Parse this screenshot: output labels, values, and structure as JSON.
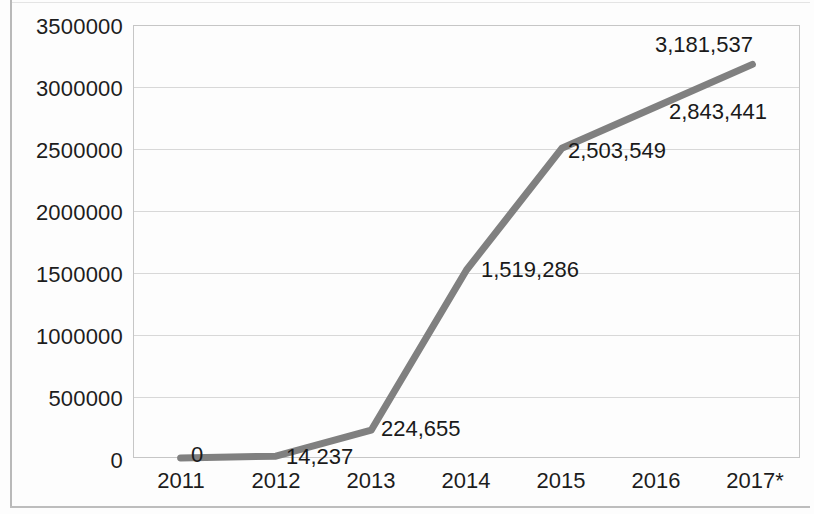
{
  "chart_data": {
    "type": "line",
    "title": "",
    "subtitle": "",
    "xlabel": "",
    "ylabel": "",
    "categories": [
      "2011",
      "2012",
      "2013",
      "2014",
      "2015",
      "2016",
      "2017*"
    ],
    "x": [
      "2011",
      "2012",
      "2013",
      "2014",
      "2015",
      "2016",
      "2017*"
    ],
    "values": [
      0,
      14237,
      224655,
      1519286,
      2503549,
      2843441,
      3181537
    ],
    "data_labels": [
      "0",
      "14,237",
      "224,655",
      "1,519,286",
      "2,503,549",
      "2,843,441",
      "3,181,537"
    ],
    "series": [
      {
        "name": "",
        "values": [
          0,
          14237,
          224655,
          1519286,
          2503549,
          2843441,
          3181537
        ],
        "color": "#808080"
      }
    ],
    "ylim": [
      0,
      3500000
    ],
    "y_tick_values": [
      0,
      500000,
      1000000,
      1500000,
      2000000,
      2500000,
      3000000,
      3500000
    ],
    "y_tick_labels": [
      "0",
      "500000",
      "1000000",
      "1500000",
      "2000000",
      "2500000",
      "3000000",
      "3500000"
    ],
    "grid": true,
    "grid_color": "#d8d8d8",
    "legend": "none",
    "plot_border_color": "#c6c6c6",
    "line_color": "#808080",
    "line_width": 7,
    "background": "#fdfdfd",
    "text_color": "#1d1d1d",
    "markers": false
  },
  "axis": {
    "y_labels": [
      "3500000",
      "3000000",
      "2500000",
      "2000000",
      "1500000",
      "1000000",
      "500000",
      "0"
    ],
    "x_labels": [
      "2011",
      "2012",
      "2013",
      "2014",
      "2015",
      "2016",
      "2017*"
    ]
  },
  "labels": {
    "p2011": "0",
    "p2012": "14,237",
    "p2013": "224,655",
    "p2014": "1,519,286",
    "p2015": "2,503,549",
    "p2016": "2,843,441",
    "p2017": "3,181,537"
  }
}
